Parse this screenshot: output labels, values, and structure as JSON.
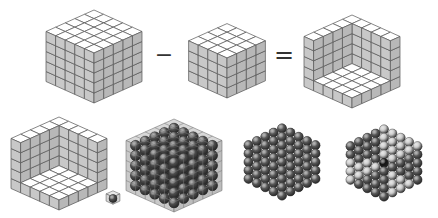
{
  "diagram": {
    "title": "Centered hexagonal numbers as differences of cubes",
    "equation": {
      "minus_symbol": "−",
      "equals_symbol": "=",
      "left_cube_size": 5,
      "right_cube_size": 4,
      "result_shape": "three-faced shell (n^3 − (n−1)^3)"
    },
    "colors": {
      "background": "#ffffff",
      "cube_top": "#ffffff",
      "cube_left": "#c8c8c8",
      "cube_right": "#b8b8b8",
      "edge": "#555555",
      "sphere_dark": "#5a5a5a",
      "sphere_light": "#c4c4c4",
      "sphere_center": "#151515",
      "symbol": "#333333"
    },
    "panels": [
      {
        "id": "cube-5",
        "cells": 5,
        "x": 94,
        "y": 53,
        "kind": "solid"
      },
      {
        "id": "cube-4",
        "cells": 4,
        "x": 227,
        "y": 58,
        "kind": "solid"
      },
      {
        "id": "shell-5",
        "cells": 5,
        "x": 352,
        "y": 58,
        "kind": "shell"
      },
      {
        "id": "shell-5-lower",
        "cells": 5,
        "x": 59,
        "y": 160,
        "kind": "shell"
      },
      {
        "id": "unit-cube",
        "cells": 1,
        "x": 113,
        "y": 200,
        "kind": "unit-sphere"
      },
      {
        "id": "sphere-cube",
        "cells": 5,
        "x": 174,
        "y": 162,
        "kind": "sphere-cube"
      },
      {
        "id": "sphere-hex",
        "cells": 5,
        "x": 282,
        "y": 162,
        "kind": "sphere-hex"
      },
      {
        "id": "sphere-hex-split",
        "cells": 5,
        "x": 384,
        "y": 163,
        "kind": "sphere-hex-split"
      }
    ]
  }
}
